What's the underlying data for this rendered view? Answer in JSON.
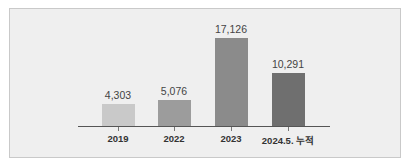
{
  "chart_data": {
    "type": "bar",
    "title": "",
    "xlabel": "",
    "ylabel": "",
    "categories": [
      "2019",
      "2022",
      "2023",
      "2024.5. 누적"
    ],
    "values": [
      4303,
      5076,
      17126,
      10291
    ],
    "value_labels": [
      "4,303",
      "5,076",
      "17,126",
      "10,291"
    ],
    "colors": [
      "#c9c9c9",
      "#9c9c9c",
      "#8b8b8b",
      "#6f6f6f"
    ],
    "ylim": [
      0,
      18000
    ],
    "grid": false,
    "legend": null
  }
}
